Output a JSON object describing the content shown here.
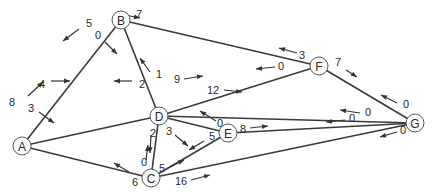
{
  "diagram": {
    "type": "network-flow-graph",
    "nodes": [
      {
        "id": "A",
        "label": "A",
        "x": 22,
        "y": 146
      },
      {
        "id": "B",
        "label": "B",
        "x": 121,
        "y": 20
      },
      {
        "id": "C",
        "label": "C",
        "x": 151,
        "y": 178
      },
      {
        "id": "D",
        "label": "D",
        "x": 159,
        "y": 116
      },
      {
        "id": "E",
        "label": "E",
        "x": 228,
        "y": 133
      },
      {
        "id": "F",
        "label": "F",
        "x": 319,
        "y": 66
      },
      {
        "id": "G",
        "label": "G",
        "x": 415,
        "y": 123
      }
    ],
    "edges": [
      {
        "from": "A",
        "to": "B",
        "cap_from": "8",
        "cap_to": "5"
      },
      {
        "from": "A",
        "to": "D",
        "cap_from": "4",
        "cap_to": "2"
      },
      {
        "from": "A",
        "to": "C",
        "cap_from": "3",
        "cap_to": "6"
      },
      {
        "from": "B",
        "to": "D",
        "cap_from": "0",
        "cap_to": "1"
      },
      {
        "from": "B",
        "to": "F",
        "cap_from": "7",
        "cap_to": "3"
      },
      {
        "from": "D",
        "to": "F",
        "cap_from": "9",
        "cap_to": "0"
      },
      {
        "from": "D",
        "to": "G",
        "cap_from": "12",
        "cap_to": "0"
      },
      {
        "from": "D",
        "to": "C",
        "cap_from": "2",
        "cap_to": "0"
      },
      {
        "from": "D",
        "to": "E",
        "cap_from": "3",
        "cap_to": "0"
      },
      {
        "from": "C",
        "to": "E",
        "cap_from": "5",
        "cap_to": "5"
      },
      {
        "from": "E",
        "to": "G",
        "cap_from": "8",
        "cap_to": "0"
      },
      {
        "from": "C",
        "to": "G",
        "cap_from": "16",
        "cap_to": "0"
      },
      {
        "from": "F",
        "to": "G",
        "cap_from": "7",
        "cap_to": "0"
      }
    ],
    "labels": [
      {
        "text": "8",
        "x": 12,
        "y": 102,
        "ax1": 28,
        "ay1": 96,
        "ax2": 43,
        "ay2": 82
      },
      {
        "text": "5",
        "x": 89,
        "y": 23,
        "ax1": 79,
        "ay1": 29,
        "ax2": 63,
        "ay2": 41
      },
      {
        "text": "4",
        "x": 42,
        "y": 84,
        "ax1": 51,
        "ay1": 81,
        "ax2": 70,
        "ay2": 81
      },
      {
        "text": "2",
        "x": 142,
        "y": 84,
        "ax1": 132,
        "ay1": 81,
        "ax2": 114,
        "ay2": 81
      },
      {
        "text": "3",
        "x": 31,
        "y": 108,
        "ax1": 39,
        "ay1": 112,
        "ax2": 54,
        "ay2": 123
      },
      {
        "text": "6",
        "x": 135,
        "y": 182,
        "ax1": 129,
        "ay1": 172,
        "ax2": 114,
        "ay2": 163
      },
      {
        "text": "0",
        "x": 98,
        "y": 35,
        "ax1": 105,
        "ay1": 42,
        "ax2": 117,
        "ay2": 54
      },
      {
        "text": "1",
        "x": 159,
        "y": 74,
        "ax1": 150,
        "ay1": 72,
        "ax2": 140,
        "ay2": 58
      },
      {
        "text": "7",
        "x": 139,
        "y": 14,
        "ax1": 120,
        "ay1": 14,
        "ax2": 140,
        "ay2": 18
      },
      {
        "text": "3",
        "x": 302,
        "y": 55,
        "ax1": 297,
        "ay1": 53,
        "ax2": 279,
        "ay2": 48
      },
      {
        "text": "9",
        "x": 177,
        "y": 79,
        "ax1": 184,
        "ay1": 79,
        "ax2": 203,
        "ay2": 76
      },
      {
        "text": "0",
        "x": 281,
        "y": 66,
        "ax1": 275,
        "ay1": 67,
        "ax2": 256,
        "ay2": 69
      },
      {
        "text": "12",
        "x": 213,
        "y": 90,
        "ax1": 224,
        "ay1": 90,
        "ax2": 242,
        "ay2": 92
      },
      {
        "text": "0",
        "x": 368,
        "y": 112,
        "ax1": 360,
        "ay1": 113,
        "ax2": 340,
        "ay2": 110
      },
      {
        "text": "2",
        "x": 153,
        "y": 133,
        "ax1": 151,
        "ay1": 135,
        "ax2": 150,
        "ay2": 153
      },
      {
        "text": "0",
        "x": 144,
        "y": 162,
        "ax1": 146,
        "ay1": 160,
        "ax2": 148,
        "ay2": 145
      },
      {
        "text": "3",
        "x": 169,
        "y": 131,
        "ax1": 175,
        "ay1": 135,
        "ax2": 188,
        "ay2": 146
      },
      {
        "text": "0",
        "x": 220,
        "y": 123,
        "ax1": 216,
        "ay1": 121,
        "ax2": 200,
        "ay2": 111
      },
      {
        "text": "5",
        "x": 162,
        "y": 168,
        "ax1": 170,
        "ay1": 167,
        "ax2": 184,
        "ay2": 160
      },
      {
        "text": "5",
        "x": 212,
        "y": 136,
        "ax1": 204,
        "ay1": 141,
        "ax2": 189,
        "ay2": 150
      },
      {
        "text": "8",
        "x": 243,
        "y": 129,
        "ax1": 250,
        "ay1": 128,
        "ax2": 268,
        "ay2": 126
      },
      {
        "text": "0",
        "x": 352,
        "y": 118,
        "ax1": 345,
        "ay1": 120,
        "ax2": 326,
        "ay2": 122
      },
      {
        "text": "16",
        "x": 181,
        "y": 181,
        "ax1": 191,
        "ay1": 180,
        "ax2": 210,
        "ay2": 175
      },
      {
        "text": "0",
        "x": 403,
        "y": 130,
        "ax1": 397,
        "ay1": 132,
        "ax2": 380,
        "ay2": 137
      },
      {
        "text": "7",
        "x": 338,
        "y": 62,
        "ax1": 346,
        "ay1": 70,
        "ax2": 357,
        "ay2": 77
      },
      {
        "text": "0",
        "x": 406,
        "y": 104,
        "ax1": 397,
        "ay1": 103,
        "ax2": 381,
        "ay2": 95
      }
    ]
  }
}
